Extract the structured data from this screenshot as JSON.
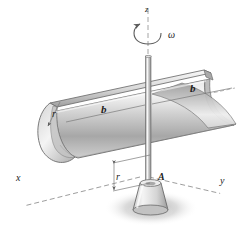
{
  "figure": {
    "labels": {
      "axis_x": "x",
      "axis_y": "y",
      "axis_z": "z",
      "angular_velocity": "ω",
      "length_left": "b",
      "length_right": "b",
      "radius_tube": "r",
      "radius_offset": "r",
      "point_a": "A"
    },
    "colors": {
      "background": "#ffffff",
      "metal_light": "#f2f2f2",
      "metal_mid": "#c9c9c9",
      "metal_dark": "#8d8d8d",
      "outline": "#6d6d6d",
      "dashed_axis": "#8e8e8e",
      "shadow": "#b9b9b9",
      "text": "#1c1c1c"
    },
    "elements": {
      "tube": "half-open cylindrical shell",
      "shaft": "vertical rod along z-axis",
      "pedestal": "truncated cone base support",
      "rotation_arrow": "curved arrow about z-axis",
      "ground_shadow": "elliptical drop shadow"
    }
  }
}
